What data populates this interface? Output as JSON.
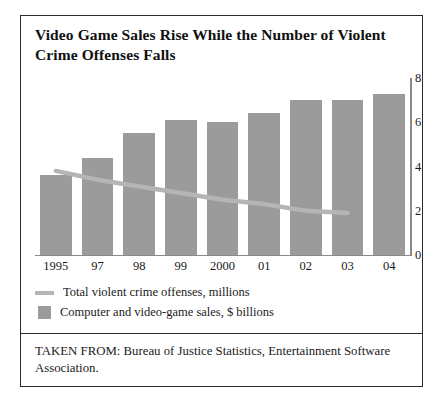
{
  "figure": {
    "title": "Video Game Sales Rise While the Number of Violent Crime Offenses Falls",
    "source_note": "TAKEN FROM: Bureau of Justice Statistics, Entertainment Software Association."
  },
  "legend": {
    "line_label": "Total violent crime offenses, millions",
    "bar_label": "Computer and video-game sales, $ billions"
  },
  "chart_data": {
    "type": "bar",
    "title": "Video Game Sales Rise While the Number of Violent Crime Offenses Falls",
    "xlabel": "",
    "ylabel": "",
    "ylim": [
      0,
      8
    ],
    "yticks": [
      0,
      2,
      4,
      6,
      8
    ],
    "ytick_labels": [
      "0",
      "2",
      "4",
      "6",
      "8"
    ],
    "grid": false,
    "legend_position": "below-plot",
    "axis_side": "right",
    "categories": [
      "1995",
      "97",
      "98",
      "99",
      "2000",
      "01",
      "02",
      "03",
      "04"
    ],
    "series": [
      {
        "name": "Computer and video-game sales, $ billions",
        "type": "bar",
        "color": "#9b9b9b",
        "values": [
          3.6,
          4.4,
          5.5,
          6.1,
          6.0,
          6.4,
          7.0,
          7.0,
          7.3
        ]
      },
      {
        "name": "Total violent crime offenses, millions",
        "type": "line",
        "color": "#b5b5b5",
        "x": [
          "1995",
          "97",
          "98",
          "99",
          "2000",
          "01",
          "02",
          "03"
        ],
        "values": [
          3.8,
          3.4,
          3.1,
          2.8,
          2.5,
          2.3,
          2.0,
          1.9
        ]
      }
    ]
  }
}
